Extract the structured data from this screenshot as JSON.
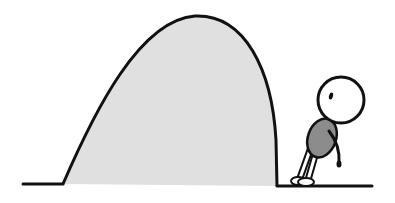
{
  "illustration": {
    "description": "Cartoon of a small round-headed figure leaning against the steep side of a large gray mound",
    "colors": {
      "background": "#ffffff",
      "outline": "#111111",
      "mound_fill": "#e0e0e0",
      "body_fill": "#8c8c8c",
      "head_fill": "#ffffff"
    },
    "elements": [
      "ground-left",
      "mound",
      "ground-right",
      "figure"
    ]
  }
}
